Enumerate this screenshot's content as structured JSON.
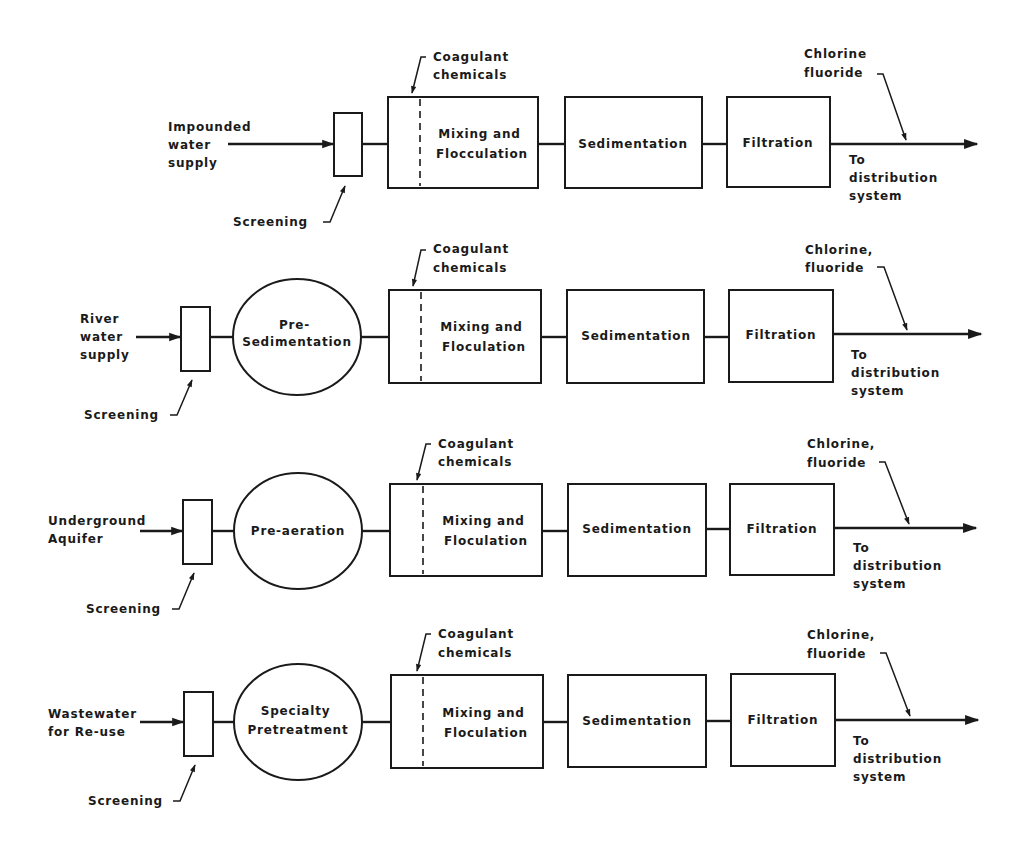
{
  "diagram": {
    "type": "water-treatment-process-flow",
    "common": {
      "screening": "Screening",
      "coagulant": [
        "Coagulant",
        "chemicals"
      ],
      "sedimentation": "Sedimentation",
      "filtration": "Filtration",
      "output": [
        "To",
        "distribution",
        "system"
      ]
    },
    "rows": [
      {
        "source": [
          "Impounded",
          "water",
          "supply"
        ],
        "pretreatment": null,
        "mixing": [
          "Mixing and",
          "Flocculation"
        ],
        "chlorine": [
          "Chlorine",
          "fluoride"
        ],
        "y": 144
      },
      {
        "source": [
          "River",
          "water",
          "supply"
        ],
        "pretreatment": [
          "Pre-",
          "Sedimentation"
        ],
        "mixing": [
          "Mixing and",
          "Floculation"
        ],
        "chlorine": [
          "Chlorine,",
          "fluoride"
        ],
        "y": 337
      },
      {
        "source": [
          "Underground",
          "Aquifer"
        ],
        "pretreatment": [
          "Pre-aeration"
        ],
        "mixing": [
          "Mixing and",
          "Floculation"
        ],
        "chlorine": [
          "Chlorine,",
          "fluoride"
        ],
        "y": 531
      },
      {
        "source": [
          "Wastewater",
          "for Re-use"
        ],
        "pretreatment": [
          "Specialty",
          "Pretreatment"
        ],
        "mixing": [
          "Mixing and",
          "Floculation"
        ],
        "chlorine": [
          "Chlorine,",
          "fluoride"
        ],
        "y": 722
      }
    ]
  }
}
